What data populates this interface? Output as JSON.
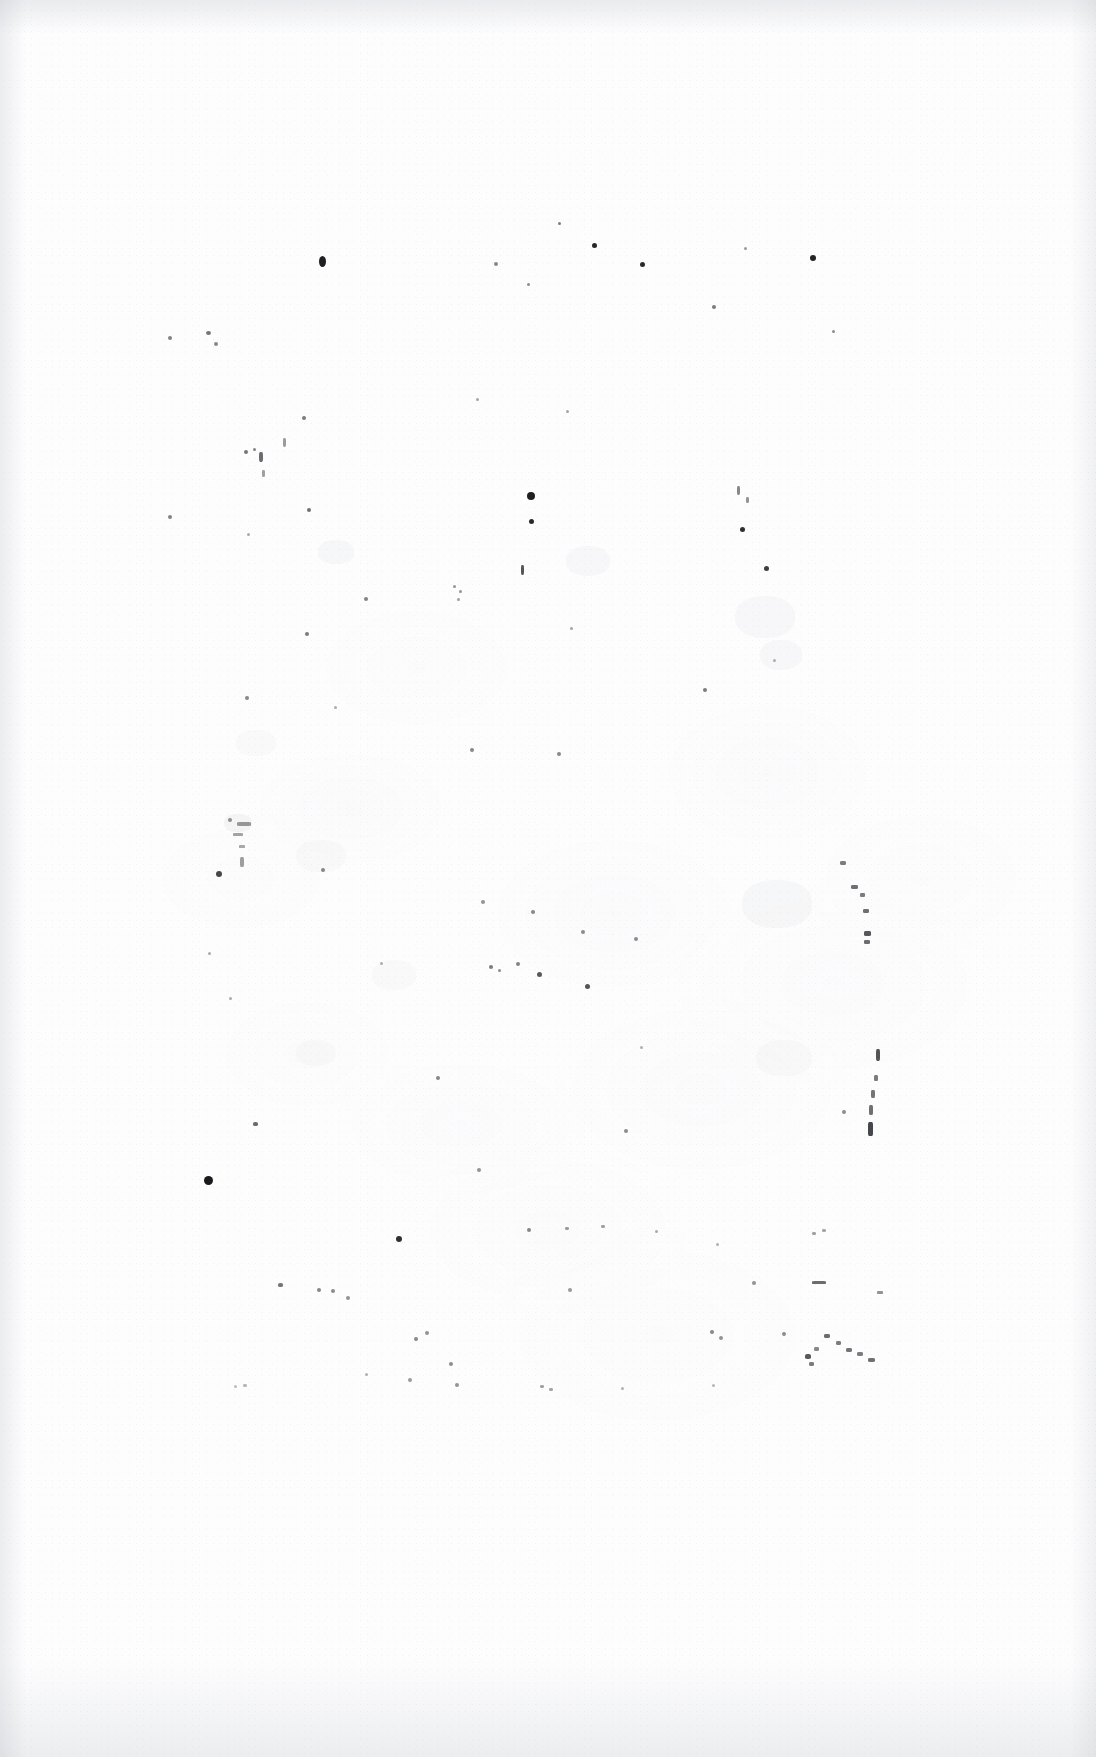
{
  "document": {
    "kind": "scanned-page",
    "content_description": "Blank scanned book page (verso) with scattered ink specks and faint paper mottling",
    "page_width": 1096,
    "page_height": 1757,
    "background_color": "#fdfdfe",
    "ink_color": "#111317",
    "edge_shadow_color": "#969ba5",
    "visible_text": "",
    "text_blocks": [],
    "headings": [],
    "page_number": ""
  },
  "edges": {
    "top_label": "scan-edge-top",
    "bottom_label": "scan-edge-bottom",
    "left_label": "scan-edge-left",
    "right_label": "scan-edge-right"
  },
  "specks": [
    {
      "x": 319,
      "y": 256,
      "w": 7,
      "h": 11,
      "r": 50,
      "o": 0.95
    },
    {
      "x": 592,
      "y": 243,
      "w": 5,
      "h": 5,
      "r": 50,
      "o": 0.92
    },
    {
      "x": 640,
      "y": 262,
      "w": 5,
      "h": 5,
      "r": 50,
      "o": 0.9
    },
    {
      "x": 810,
      "y": 255,
      "w": 6,
      "h": 6,
      "r": 50,
      "o": 0.93
    },
    {
      "x": 558,
      "y": 222,
      "w": 3,
      "h": 3,
      "r": 50,
      "o": 0.55
    },
    {
      "x": 494,
      "y": 262,
      "w": 4,
      "h": 4,
      "r": 50,
      "o": 0.5
    },
    {
      "x": 527,
      "y": 283,
      "w": 3,
      "h": 3,
      "r": 50,
      "o": 0.48
    },
    {
      "x": 744,
      "y": 247,
      "w": 3,
      "h": 3,
      "r": 50,
      "o": 0.42
    },
    {
      "x": 712,
      "y": 305,
      "w": 4,
      "h": 4,
      "r": 50,
      "o": 0.55
    },
    {
      "x": 832,
      "y": 330,
      "w": 3,
      "h": 3,
      "r": 50,
      "o": 0.48
    },
    {
      "x": 168,
      "y": 336,
      "w": 4,
      "h": 4,
      "r": 50,
      "o": 0.52
    },
    {
      "x": 206,
      "y": 331,
      "w": 5,
      "h": 4,
      "r": 50,
      "o": 0.58
    },
    {
      "x": 214,
      "y": 342,
      "w": 4,
      "h": 4,
      "r": 50,
      "o": 0.5
    },
    {
      "x": 302,
      "y": 416,
      "w": 4,
      "h": 4,
      "r": 50,
      "o": 0.55
    },
    {
      "x": 476,
      "y": 398,
      "w": 3,
      "h": 3,
      "r": 50,
      "o": 0.38
    },
    {
      "x": 566,
      "y": 410,
      "w": 3,
      "h": 3,
      "r": 50,
      "o": 0.38
    },
    {
      "x": 244,
      "y": 450,
      "w": 4,
      "h": 4,
      "r": 50,
      "o": 0.58
    },
    {
      "x": 253,
      "y": 448,
      "w": 3,
      "h": 3,
      "r": 50,
      "o": 0.52
    },
    {
      "x": 259,
      "y": 452,
      "w": 4,
      "h": 10,
      "r": 30,
      "o": 0.62
    },
    {
      "x": 283,
      "y": 438,
      "w": 3,
      "h": 9,
      "r": 30,
      "o": 0.42
    },
    {
      "x": 262,
      "y": 470,
      "w": 3,
      "h": 7,
      "r": 30,
      "o": 0.4
    },
    {
      "x": 527,
      "y": 492,
      "w": 8,
      "h": 8,
      "r": 50,
      "o": 0.95
    },
    {
      "x": 529,
      "y": 519,
      "w": 5,
      "h": 5,
      "r": 50,
      "o": 0.9
    },
    {
      "x": 307,
      "y": 508,
      "w": 4,
      "h": 4,
      "r": 50,
      "o": 0.6
    },
    {
      "x": 168,
      "y": 515,
      "w": 4,
      "h": 4,
      "r": 50,
      "o": 0.52
    },
    {
      "x": 740,
      "y": 527,
      "w": 5,
      "h": 5,
      "r": 50,
      "o": 0.88
    },
    {
      "x": 737,
      "y": 486,
      "w": 3,
      "h": 9,
      "r": 30,
      "o": 0.5
    },
    {
      "x": 746,
      "y": 497,
      "w": 3,
      "h": 6,
      "r": 30,
      "o": 0.45
    },
    {
      "x": 764,
      "y": 566,
      "w": 5,
      "h": 5,
      "r": 50,
      "o": 0.82
    },
    {
      "x": 521,
      "y": 565,
      "w": 3,
      "h": 10,
      "r": 30,
      "o": 0.72
    },
    {
      "x": 247,
      "y": 533,
      "w": 3,
      "h": 3,
      "r": 50,
      "o": 0.35
    },
    {
      "x": 364,
      "y": 597,
      "w": 4,
      "h": 4,
      "r": 50,
      "o": 0.52
    },
    {
      "x": 453,
      "y": 585,
      "w": 3,
      "h": 3,
      "r": 50,
      "o": 0.45
    },
    {
      "x": 459,
      "y": 590,
      "w": 3,
      "h": 3,
      "r": 50,
      "o": 0.45
    },
    {
      "x": 457,
      "y": 598,
      "w": 3,
      "h": 3,
      "r": 50,
      "o": 0.4
    },
    {
      "x": 305,
      "y": 632,
      "w": 4,
      "h": 4,
      "r": 50,
      "o": 0.55
    },
    {
      "x": 570,
      "y": 627,
      "w": 3,
      "h": 3,
      "r": 50,
      "o": 0.38
    },
    {
      "x": 334,
      "y": 706,
      "w": 3,
      "h": 3,
      "r": 50,
      "o": 0.35
    },
    {
      "x": 245,
      "y": 696,
      "w": 4,
      "h": 4,
      "r": 50,
      "o": 0.5
    },
    {
      "x": 703,
      "y": 688,
      "w": 4,
      "h": 4,
      "r": 50,
      "o": 0.55
    },
    {
      "x": 470,
      "y": 748,
      "w": 4,
      "h": 4,
      "r": 50,
      "o": 0.5
    },
    {
      "x": 557,
      "y": 752,
      "w": 4,
      "h": 4,
      "r": 50,
      "o": 0.5
    },
    {
      "x": 773,
      "y": 659,
      "w": 3,
      "h": 3,
      "r": 50,
      "o": 0.32
    },
    {
      "x": 228,
      "y": 818,
      "w": 4,
      "h": 4,
      "r": 50,
      "o": 0.45
    },
    {
      "x": 237,
      "y": 822,
      "w": 14,
      "h": 4,
      "r": 20,
      "o": 0.42
    },
    {
      "x": 233,
      "y": 833,
      "w": 10,
      "h": 3,
      "r": 20,
      "o": 0.38
    },
    {
      "x": 239,
      "y": 845,
      "w": 6,
      "h": 3,
      "r": 20,
      "o": 0.36
    },
    {
      "x": 240,
      "y": 857,
      "w": 4,
      "h": 10,
      "r": 25,
      "o": 0.4
    },
    {
      "x": 216,
      "y": 871,
      "w": 6,
      "h": 6,
      "r": 50,
      "o": 0.78
    },
    {
      "x": 321,
      "y": 868,
      "w": 4,
      "h": 4,
      "r": 50,
      "o": 0.5
    },
    {
      "x": 840,
      "y": 861,
      "w": 6,
      "h": 4,
      "r": 30,
      "o": 0.55
    },
    {
      "x": 851,
      "y": 885,
      "w": 7,
      "h": 4,
      "r": 25,
      "o": 0.6
    },
    {
      "x": 860,
      "y": 893,
      "w": 5,
      "h": 4,
      "r": 25,
      "o": 0.55
    },
    {
      "x": 863,
      "y": 909,
      "w": 6,
      "h": 4,
      "r": 25,
      "o": 0.6
    },
    {
      "x": 864,
      "y": 931,
      "w": 7,
      "h": 5,
      "r": 25,
      "o": 0.7
    },
    {
      "x": 864,
      "y": 940,
      "w": 6,
      "h": 4,
      "r": 25,
      "o": 0.62
    },
    {
      "x": 481,
      "y": 900,
      "w": 4,
      "h": 4,
      "r": 50,
      "o": 0.45
    },
    {
      "x": 531,
      "y": 910,
      "w": 4,
      "h": 4,
      "r": 50,
      "o": 0.5
    },
    {
      "x": 581,
      "y": 930,
      "w": 4,
      "h": 4,
      "r": 50,
      "o": 0.48
    },
    {
      "x": 634,
      "y": 937,
      "w": 4,
      "h": 4,
      "r": 50,
      "o": 0.48
    },
    {
      "x": 208,
      "y": 952,
      "w": 3,
      "h": 3,
      "r": 50,
      "o": 0.35
    },
    {
      "x": 380,
      "y": 962,
      "w": 3,
      "h": 3,
      "r": 50,
      "o": 0.32
    },
    {
      "x": 489,
      "y": 965,
      "w": 4,
      "h": 4,
      "r": 50,
      "o": 0.55
    },
    {
      "x": 498,
      "y": 969,
      "w": 3,
      "h": 3,
      "r": 50,
      "o": 0.48
    },
    {
      "x": 516,
      "y": 962,
      "w": 4,
      "h": 4,
      "r": 50,
      "o": 0.52
    },
    {
      "x": 537,
      "y": 972,
      "w": 5,
      "h": 5,
      "r": 50,
      "o": 0.7
    },
    {
      "x": 585,
      "y": 984,
      "w": 5,
      "h": 5,
      "r": 50,
      "o": 0.72
    },
    {
      "x": 229,
      "y": 997,
      "w": 3,
      "h": 3,
      "r": 50,
      "o": 0.35
    },
    {
      "x": 640,
      "y": 1046,
      "w": 3,
      "h": 3,
      "r": 50,
      "o": 0.32
    },
    {
      "x": 876,
      "y": 1049,
      "w": 4,
      "h": 12,
      "r": 25,
      "o": 0.72
    },
    {
      "x": 874,
      "y": 1075,
      "w": 4,
      "h": 6,
      "r": 25,
      "o": 0.55
    },
    {
      "x": 871,
      "y": 1090,
      "w": 4,
      "h": 8,
      "r": 25,
      "o": 0.58
    },
    {
      "x": 869,
      "y": 1105,
      "w": 4,
      "h": 10,
      "r": 25,
      "o": 0.6
    },
    {
      "x": 868,
      "y": 1122,
      "w": 5,
      "h": 14,
      "r": 25,
      "o": 0.78
    },
    {
      "x": 842,
      "y": 1110,
      "w": 4,
      "h": 4,
      "r": 50,
      "o": 0.48
    },
    {
      "x": 436,
      "y": 1076,
      "w": 4,
      "h": 4,
      "r": 50,
      "o": 0.5
    },
    {
      "x": 253,
      "y": 1122,
      "w": 5,
      "h": 4,
      "r": 40,
      "o": 0.62
    },
    {
      "x": 624,
      "y": 1129,
      "w": 4,
      "h": 4,
      "r": 50,
      "o": 0.48
    },
    {
      "x": 477,
      "y": 1168,
      "w": 4,
      "h": 4,
      "r": 50,
      "o": 0.45
    },
    {
      "x": 204,
      "y": 1176,
      "w": 9,
      "h": 9,
      "r": 50,
      "o": 0.97
    },
    {
      "x": 396,
      "y": 1236,
      "w": 6,
      "h": 6,
      "r": 50,
      "o": 0.88
    },
    {
      "x": 527,
      "y": 1228,
      "w": 4,
      "h": 4,
      "r": 50,
      "o": 0.5
    },
    {
      "x": 565,
      "y": 1227,
      "w": 4,
      "h": 3,
      "r": 40,
      "o": 0.42
    },
    {
      "x": 601,
      "y": 1225,
      "w": 4,
      "h": 3,
      "r": 40,
      "o": 0.4
    },
    {
      "x": 655,
      "y": 1230,
      "w": 3,
      "h": 3,
      "r": 50,
      "o": 0.35
    },
    {
      "x": 716,
      "y": 1243,
      "w": 3,
      "h": 3,
      "r": 50,
      "o": 0.32
    },
    {
      "x": 812,
      "y": 1232,
      "w": 4,
      "h": 3,
      "r": 40,
      "o": 0.4
    },
    {
      "x": 822,
      "y": 1229,
      "w": 4,
      "h": 3,
      "r": 40,
      "o": 0.38
    },
    {
      "x": 278,
      "y": 1283,
      "w": 5,
      "h": 4,
      "r": 40,
      "o": 0.58
    },
    {
      "x": 317,
      "y": 1288,
      "w": 4,
      "h": 4,
      "r": 50,
      "o": 0.5
    },
    {
      "x": 331,
      "y": 1289,
      "w": 4,
      "h": 4,
      "r": 50,
      "o": 0.48
    },
    {
      "x": 346,
      "y": 1296,
      "w": 4,
      "h": 4,
      "r": 50,
      "o": 0.45
    },
    {
      "x": 568,
      "y": 1288,
      "w": 4,
      "h": 4,
      "r": 50,
      "o": 0.42
    },
    {
      "x": 752,
      "y": 1281,
      "w": 4,
      "h": 4,
      "r": 50,
      "o": 0.45
    },
    {
      "x": 812,
      "y": 1281,
      "w": 14,
      "h": 3,
      "r": 20,
      "o": 0.62
    },
    {
      "x": 877,
      "y": 1291,
      "w": 6,
      "h": 3,
      "r": 20,
      "o": 0.45
    },
    {
      "x": 710,
      "y": 1330,
      "w": 4,
      "h": 4,
      "r": 50,
      "o": 0.5
    },
    {
      "x": 719,
      "y": 1336,
      "w": 4,
      "h": 4,
      "r": 50,
      "o": 0.45
    },
    {
      "x": 782,
      "y": 1332,
      "w": 4,
      "h": 4,
      "r": 50,
      "o": 0.48
    },
    {
      "x": 824,
      "y": 1334,
      "w": 6,
      "h": 4,
      "r": 30,
      "o": 0.62
    },
    {
      "x": 836,
      "y": 1341,
      "w": 5,
      "h": 4,
      "r": 30,
      "o": 0.55
    },
    {
      "x": 846,
      "y": 1348,
      "w": 6,
      "h": 4,
      "r": 30,
      "o": 0.58
    },
    {
      "x": 857,
      "y": 1352,
      "w": 6,
      "h": 4,
      "r": 30,
      "o": 0.55
    },
    {
      "x": 868,
      "y": 1358,
      "w": 7,
      "h": 4,
      "r": 30,
      "o": 0.6
    },
    {
      "x": 814,
      "y": 1347,
      "w": 5,
      "h": 4,
      "r": 30,
      "o": 0.5
    },
    {
      "x": 805,
      "y": 1354,
      "w": 6,
      "h": 5,
      "r": 35,
      "o": 0.7
    },
    {
      "x": 809,
      "y": 1362,
      "w": 5,
      "h": 4,
      "r": 30,
      "o": 0.55
    },
    {
      "x": 414,
      "y": 1337,
      "w": 4,
      "h": 4,
      "r": 50,
      "o": 0.5
    },
    {
      "x": 425,
      "y": 1331,
      "w": 4,
      "h": 4,
      "r": 50,
      "o": 0.45
    },
    {
      "x": 449,
      "y": 1362,
      "w": 4,
      "h": 4,
      "r": 50,
      "o": 0.48
    },
    {
      "x": 455,
      "y": 1383,
      "w": 4,
      "h": 4,
      "r": 50,
      "o": 0.45
    },
    {
      "x": 408,
      "y": 1378,
      "w": 4,
      "h": 4,
      "r": 50,
      "o": 0.42
    },
    {
      "x": 365,
      "y": 1373,
      "w": 3,
      "h": 3,
      "r": 50,
      "o": 0.32
    },
    {
      "x": 540,
      "y": 1385,
      "w": 4,
      "h": 3,
      "r": 40,
      "o": 0.4
    },
    {
      "x": 549,
      "y": 1388,
      "w": 4,
      "h": 3,
      "r": 40,
      "o": 0.38
    },
    {
      "x": 621,
      "y": 1387,
      "w": 3,
      "h": 3,
      "r": 50,
      "o": 0.32
    },
    {
      "x": 712,
      "y": 1384,
      "w": 3,
      "h": 3,
      "r": 50,
      "o": 0.3
    },
    {
      "x": 234,
      "y": 1385,
      "w": 3,
      "h": 3,
      "r": 50,
      "o": 0.28
    },
    {
      "x": 243,
      "y": 1384,
      "w": 4,
      "h": 3,
      "r": 40,
      "o": 0.3
    }
  ],
  "smudges": [
    {
      "x": 224,
      "y": 814,
      "w": 28,
      "h": 18,
      "o": 0.22
    },
    {
      "x": 318,
      "y": 540,
      "w": 36,
      "h": 24,
      "o": 0.14
    },
    {
      "x": 566,
      "y": 546,
      "w": 44,
      "h": 30,
      "o": 0.12
    },
    {
      "x": 735,
      "y": 596,
      "w": 60,
      "h": 42,
      "o": 0.12
    },
    {
      "x": 760,
      "y": 640,
      "w": 42,
      "h": 30,
      "o": 0.12
    },
    {
      "x": 236,
      "y": 730,
      "w": 40,
      "h": 26,
      "o": 0.1
    },
    {
      "x": 296,
      "y": 840,
      "w": 50,
      "h": 32,
      "o": 0.1
    },
    {
      "x": 742,
      "y": 880,
      "w": 70,
      "h": 48,
      "o": 0.14
    },
    {
      "x": 372,
      "y": 960,
      "w": 44,
      "h": 30,
      "o": 0.1
    },
    {
      "x": 296,
      "y": 1040,
      "w": 40,
      "h": 26,
      "o": 0.09
    },
    {
      "x": 756,
      "y": 1040,
      "w": 56,
      "h": 36,
      "o": 0.1
    }
  ]
}
